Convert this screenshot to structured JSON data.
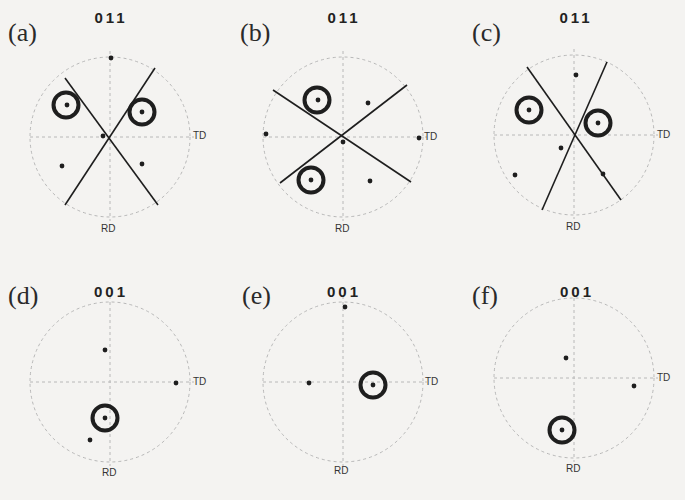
{
  "figure": {
    "panels": [
      {
        "id": "a",
        "label": "(a)",
        "pole": "011",
        "td_label": "TD",
        "rd_label": "RD",
        "center": [
          110,
          137
        ],
        "radius": 80,
        "label_pos": [
          8,
          20
        ],
        "lines": [
          [
            [
              65,
              78
            ],
            [
              158,
              205
            ]
          ],
          [
            [
              155,
              68
            ],
            [
              65,
              205
            ]
          ]
        ],
        "dots": [
          [
            111,
            58
          ],
          [
            67,
            105
          ],
          [
            142,
            112
          ],
          [
            103,
            136
          ],
          [
            62,
            166
          ],
          [
            142,
            164
          ]
        ],
        "circles": [
          [
            66,
            105
          ],
          [
            142,
            112
          ]
        ]
      },
      {
        "id": "b",
        "label": "(b)",
        "pole": "011",
        "td_label": "TD",
        "rd_label": "RD",
        "center": [
          343,
          137
        ],
        "radius": 80,
        "label_pos": [
          240,
          20
        ],
        "lines": [
          [
            [
              273,
              90
            ],
            [
              411,
              182
            ]
          ],
          [
            [
              407,
              85
            ],
            [
              280,
              183
            ]
          ]
        ],
        "dots": [
          [
            318,
            100
          ],
          [
            368,
            103
          ],
          [
            266,
            134
          ],
          [
            419,
            138
          ],
          [
            343,
            142
          ],
          [
            311,
            180
          ],
          [
            370,
            181
          ]
        ],
        "circles": [
          [
            317,
            100
          ],
          [
            311,
            180
          ]
        ]
      },
      {
        "id": "c",
        "label": "(c)",
        "pole": "011",
        "td_label": "TD",
        "rd_label": "RD",
        "center": [
          574,
          135
        ],
        "radius": 80,
        "label_pos": [
          472,
          20
        ],
        "lines": [
          [
            [
              527,
              67
            ],
            [
              621,
              200
            ]
          ],
          [
            [
              607,
              62
            ],
            [
              542,
              210
            ]
          ]
        ],
        "dots": [
          [
            576,
            75
          ],
          [
            529,
            110
          ],
          [
            598,
            123
          ],
          [
            561,
            148
          ],
          [
            515,
            175
          ],
          [
            603,
            174
          ]
        ],
        "circles": [
          [
            529,
            110
          ],
          [
            598,
            123
          ]
        ]
      },
      {
        "id": "d",
        "label": "(d)",
        "pole": "001",
        "td_label": "TD",
        "rd_label": "RD",
        "center": [
          110,
          382
        ],
        "radius": 80,
        "label_pos": [
          8,
          283
        ],
        "lines": [],
        "dots": [
          [
            105,
            350
          ],
          [
            176,
            383
          ],
          [
            105,
            418
          ],
          [
            90,
            440
          ]
        ],
        "circles": [
          [
            105,
            418
          ]
        ]
      },
      {
        "id": "e",
        "label": "(e)",
        "pole": "001",
        "td_label": "TD",
        "rd_label": "RD",
        "center": [
          343,
          382
        ],
        "radius": 80,
        "label_pos": [
          242,
          283
        ],
        "lines": [],
        "dots": [
          [
            345,
            307
          ],
          [
            309,
            383
          ],
          [
            373,
            385
          ]
        ],
        "circles": [
          [
            373,
            385
          ]
        ]
      },
      {
        "id": "f",
        "label": "(f)",
        "pole": "001",
        "td_label": "TD",
        "rd_label": "RD",
        "center": [
          574,
          378
        ],
        "radius": 80,
        "label_pos": [
          472,
          283
        ],
        "lines": [],
        "dots": [
          [
            566,
            358
          ],
          [
            634,
            386
          ],
          [
            562,
            430
          ]
        ],
        "circles": [
          [
            562,
            430
          ]
        ]
      }
    ],
    "colors": {
      "background": "#f4f3f1",
      "ink": "#1e1e1e",
      "dashed": "#b8b8b8"
    }
  }
}
